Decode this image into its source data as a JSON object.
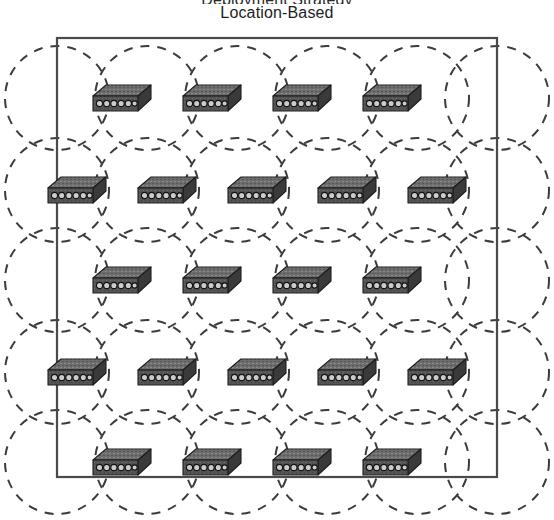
{
  "figure": {
    "title": "Location-Based",
    "title_above_clipped": "Deployment Strategy",
    "type": "network-topology-diagram"
  },
  "colors": {
    "background": "#ffffff",
    "boundary_stroke": "#4a4a4a",
    "coverage_stroke": "#3c3c3c",
    "device_top": "#6d6d6d",
    "device_front": "#545454",
    "device_side": "#3a3a3a",
    "device_outline": "#222222",
    "port_fill": "#cfcfcf",
    "port_stroke": "#1b1b1b",
    "title_text": "#1d1d1d"
  },
  "boundary": {
    "name": "deployment-area",
    "x": 57,
    "y": 38,
    "width": 440,
    "height": 439,
    "stroke_width": 2.2,
    "dash": "solid"
  },
  "coverage": {
    "radius": 52,
    "stroke_width": 2.0,
    "dash_pattern": "9 8",
    "label": "coverage-circle"
  },
  "device": {
    "label": "network-switch",
    "width": 58,
    "height": 26,
    "port_count": 6
  },
  "grid": {
    "row_spacing": 90,
    "col_spacing": 90,
    "rows": [
      {
        "index": 0,
        "y": 98,
        "count": 4,
        "xs": [
          122,
          212,
          302,
          392
        ]
      },
      {
        "index": 1,
        "y": 190,
        "count": 5,
        "xs": [
          77,
          167,
          257,
          347,
          437
        ]
      },
      {
        "index": 2,
        "y": 280,
        "count": 4,
        "xs": [
          122,
          212,
          302,
          392
        ]
      },
      {
        "index": 3,
        "y": 372,
        "count": 5,
        "xs": [
          77,
          167,
          257,
          347,
          437
        ]
      },
      {
        "index": 4,
        "y": 462,
        "count": 4,
        "xs": [
          122,
          212,
          302,
          392
        ]
      }
    ],
    "total_devices": 22
  },
  "circle_centers": {
    "rows": [
      {
        "y": 98,
        "xs": [
          57,
          147,
          237,
          327,
          417,
          497
        ]
      },
      {
        "y": 190,
        "xs": [
          57,
          147,
          237,
          327,
          417,
          497
        ]
      },
      {
        "y": 280,
        "xs": [
          57,
          147,
          237,
          327,
          417,
          497
        ]
      },
      {
        "y": 372,
        "xs": [
          57,
          147,
          237,
          327,
          417,
          497
        ]
      },
      {
        "y": 462,
        "xs": [
          57,
          147,
          237,
          327,
          417,
          497
        ]
      }
    ]
  },
  "chart_data": {
    "type": "scatter",
    "title": "Location-Based",
    "xlabel": "",
    "ylabel": "",
    "xlim": [
      57,
      497
    ],
    "ylim": [
      38,
      477
    ],
    "grid": false,
    "legend": "none",
    "series": [
      {
        "name": "network-switch",
        "marker": "switch-icon",
        "x": [
          122,
          212,
          302,
          392,
          77,
          167,
          257,
          347,
          437,
          122,
          212,
          302,
          392,
          77,
          167,
          257,
          347,
          437,
          122,
          212,
          302,
          392
        ],
        "y": [
          98,
          98,
          98,
          98,
          190,
          190,
          190,
          190,
          190,
          280,
          280,
          280,
          280,
          372,
          372,
          372,
          372,
          372,
          462,
          462,
          462,
          462
        ]
      },
      {
        "name": "coverage-footprint",
        "marker": "dashed-circle",
        "radius": 52,
        "x": [
          57,
          147,
          237,
          327,
          417,
          497,
          57,
          147,
          237,
          327,
          417,
          497,
          57,
          147,
          237,
          327,
          417,
          497,
          57,
          147,
          237,
          327,
          417,
          497,
          57,
          147,
          237,
          327,
          417,
          497
        ],
        "y": [
          98,
          98,
          98,
          98,
          98,
          98,
          190,
          190,
          190,
          190,
          190,
          190,
          280,
          280,
          280,
          280,
          280,
          280,
          372,
          372,
          372,
          372,
          372,
          372,
          462,
          462,
          462,
          462,
          462,
          462
        ]
      }
    ],
    "annotations": [
      "Location-Based"
    ]
  }
}
